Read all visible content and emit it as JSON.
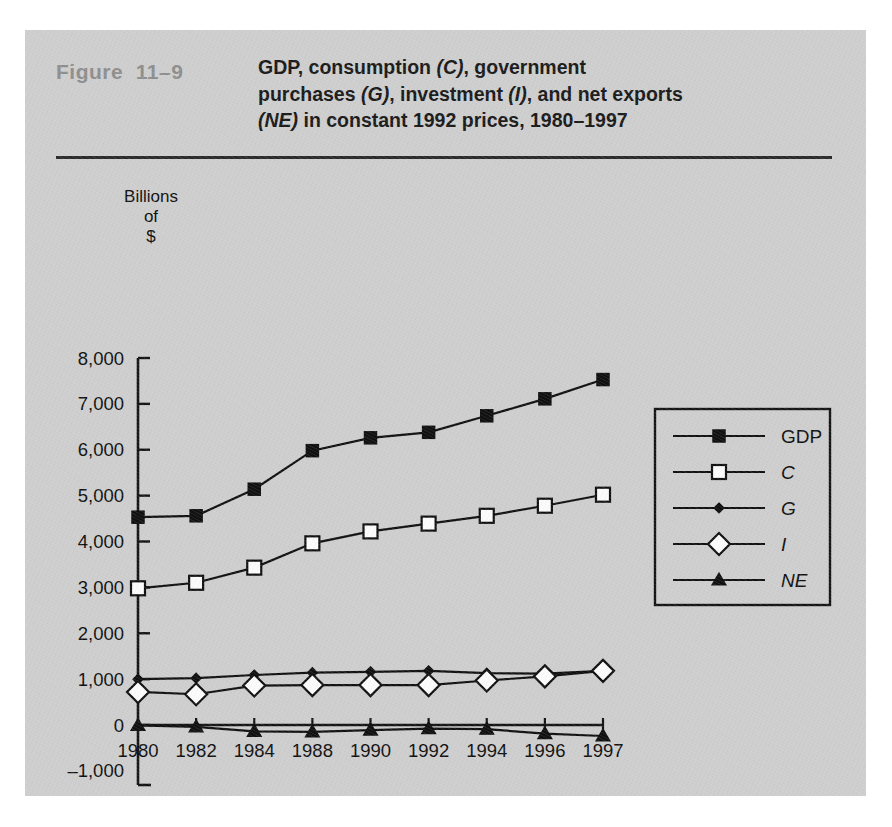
{
  "figure": {
    "number_label": "Figure  11–9",
    "title_line1_a": "GDP, consumption ",
    "title_line1_b": "(C)",
    "title_line1_c": ", government purchases",
    "title_line2_a": "(G)",
    "title_line2_b": ", investment ",
    "title_line2_c": "(I)",
    "title_line2_d": ", and net exports ",
    "title_line2_e": "(NE)",
    "title_line2_f": " in",
    "title_line3": "constant 1992 prices, 1980–1997",
    "panel_bg": "#cecece",
    "rule_color": "#2a2a2a",
    "number_color": "#8e8e8e"
  },
  "axis_caption": {
    "line1": "Billions",
    "line2": "of",
    "line3": "$"
  },
  "chart_data": {
    "type": "line",
    "title": "GDP, consumption (C), government purchases (G), investment (I), and net exports (NE) in constant 1992 prices, 1980–1997",
    "xlabel": "",
    "ylabel": "Billions of $",
    "ylim": [
      -1000,
      8000
    ],
    "ytick_labels": [
      "8,000",
      "7,000",
      "6,000",
      "5,000",
      "4,000",
      "3,000",
      "2,000",
      "1,000",
      "0",
      "–1,000"
    ],
    "ytick_values": [
      8000,
      7000,
      6000,
      5000,
      4000,
      3000,
      2000,
      1000,
      0,
      -1000
    ],
    "grid": false,
    "legend_position": "right",
    "categories": [
      "1980",
      "1982",
      "1984",
      "1988",
      "1990",
      "1992",
      "1994",
      "1996",
      "1997"
    ],
    "x": [
      1980,
      1982,
      1984,
      1988,
      1990,
      1992,
      1994,
      1996,
      1997
    ],
    "series": [
      {
        "name": "GDP",
        "marker": "filled-square",
        "italic": false,
        "values": [
          4530,
          4560,
          5140,
          5980,
          6260,
          6380,
          6740,
          7110,
          7530
        ]
      },
      {
        "name": "C",
        "marker": "open-square",
        "italic": true,
        "values": [
          2980,
          3100,
          3430,
          3960,
          4220,
          4390,
          4560,
          4780,
          5020
        ]
      },
      {
        "name": "G",
        "marker": "small-filled-diamond",
        "italic": true,
        "values": [
          1000,
          1020,
          1090,
          1140,
          1160,
          1180,
          1130,
          1120,
          1180
        ]
      },
      {
        "name": "I",
        "marker": "open-diamond",
        "italic": true,
        "values": [
          720,
          670,
          860,
          870,
          870,
          870,
          970,
          1060,
          1180
        ]
      },
      {
        "name": "NE",
        "marker": "filled-triangle",
        "italic": true,
        "values": [
          -10,
          -40,
          -140,
          -150,
          -110,
          -80,
          -90,
          -190,
          -240
        ]
      }
    ]
  },
  "legend": {
    "entries": [
      {
        "label": "GDP",
        "italic": false
      },
      {
        "label": "C",
        "italic": true
      },
      {
        "label": "G",
        "italic": true
      },
      {
        "label": "I",
        "italic": true
      },
      {
        "label": "NE",
        "italic": true
      }
    ]
  }
}
